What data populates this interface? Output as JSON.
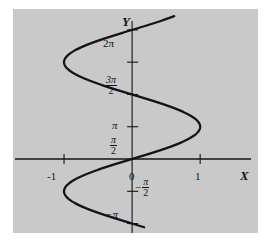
{
  "figure": {
    "panel_bg": "#c9c9c9",
    "page_bg": "#ffffff",
    "ink": "#141414"
  },
  "axes": {
    "x_axis_label": "X",
    "y_axis_label": "Y",
    "origin_label": "0"
  },
  "x_ticks": [
    {
      "label": "-1",
      "value": -1
    },
    {
      "label": "1",
      "value": 1
    }
  ],
  "y_ticks": [
    {
      "id": "two-pi",
      "value": 6.2832,
      "display": "2π",
      "kind": "plain"
    },
    {
      "id": "three-pi-over-two",
      "value": 4.7124,
      "display": "3π/2",
      "kind": "fraction",
      "numerator": "3π",
      "denominator": "2"
    },
    {
      "id": "pi",
      "value": 3.1416,
      "display": "π",
      "kind": "plain"
    },
    {
      "id": "pi-over-two",
      "value": 1.5708,
      "display": "π/2",
      "kind": "fraction",
      "numerator": "π",
      "denominator": "2"
    },
    {
      "id": "neg-pi-over-two",
      "value": -1.5708,
      "display": "−π/2",
      "kind": "fraction",
      "sign": "−",
      "numerator": "π",
      "denominator": "2"
    },
    {
      "id": "neg-pi",
      "value": -3.1416,
      "display": "−π",
      "kind": "plain",
      "sign": "−"
    }
  ],
  "chart_data": {
    "type": "line",
    "title": "",
    "xlabel": "X",
    "ylabel": "Y",
    "relation": "x = sin(y)",
    "xlim": [
      -1.75,
      1.85
    ],
    "ylim": [
      -3.6,
      7.3
    ],
    "grid": false,
    "legend": null,
    "xticks": [
      -1,
      1
    ],
    "xticklabels": [
      "-1",
      "1"
    ],
    "yticks": [
      -3.1416,
      -1.5708,
      1.5708,
      3.1416,
      4.7124,
      6.2832
    ],
    "yticklabels": [
      "−π",
      "−π/2",
      "π/2",
      "π",
      "3π/2",
      "2π"
    ],
    "series": [
      {
        "name": "x = sin y",
        "y_start": -3.32,
        "y_end": 6.95,
        "key_points": [
          {
            "x": 0.176,
            "y": -3.32
          },
          {
            "x": 0.0,
            "y": -3.1416
          },
          {
            "x": -1.0,
            "y": -1.5708
          },
          {
            "x": 0.0,
            "y": 0.0
          },
          {
            "x": 1.0,
            "y": 1.5708
          },
          {
            "x": 0.0,
            "y": 3.1416
          },
          {
            "x": -1.0,
            "y": 4.7124
          },
          {
            "x": 0.0,
            "y": 6.2832
          },
          {
            "x": 0.607,
            "y": 6.95
          }
        ]
      }
    ]
  }
}
